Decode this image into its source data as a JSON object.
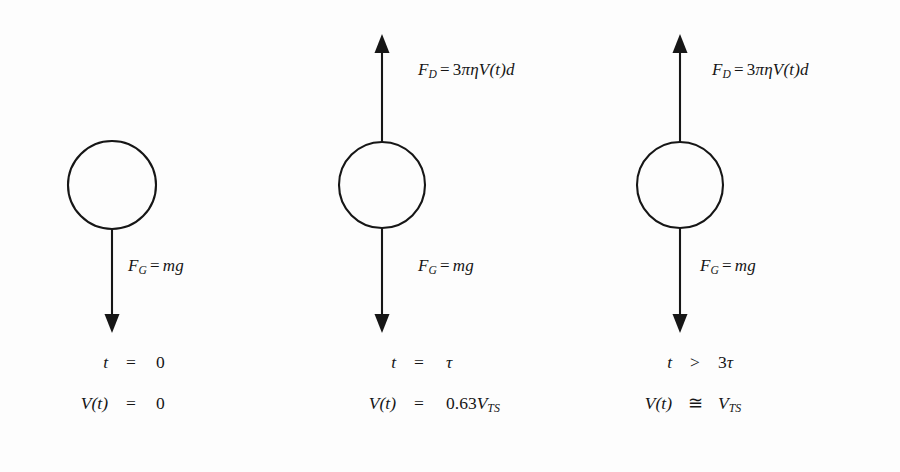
{
  "figure": {
    "background_color": "#fdfdfd",
    "stroke_color": "#161616"
  },
  "panels": [
    {
      "id": "panel-0",
      "sphere_name": "sphere",
      "drag_arrow": {
        "present": false,
        "direction": "up",
        "name": "drag-force-arrow"
      },
      "gravity_arrow": {
        "present": true,
        "direction": "down",
        "name": "gravity-force-arrow"
      },
      "drag_label": {
        "lhs": "F",
        "lhs_sub": "D",
        "op": "=",
        "coefficient": "3",
        "greek": "πη",
        "velocity": "V(t)",
        "diameter": "d",
        "full": "F_D = 3πηV(t)d"
      },
      "gravity_label": {
        "lhs": "F",
        "lhs_sub": "G",
        "op": "=",
        "rhs": "mg",
        "full": "F_G = mg"
      },
      "state": [
        {
          "symbol": "t",
          "relation": "=",
          "value_num": "0",
          "value_sym": "",
          "value_sub": ""
        },
        {
          "symbol": "V(t)",
          "relation": "=",
          "value_num": "0",
          "value_sym": "",
          "value_sub": ""
        }
      ]
    },
    {
      "id": "panel-1",
      "sphere_name": "sphere",
      "drag_arrow": {
        "present": true,
        "direction": "up",
        "name": "drag-force-arrow"
      },
      "gravity_arrow": {
        "present": true,
        "direction": "down",
        "name": "gravity-force-arrow"
      },
      "drag_label": {
        "lhs": "F",
        "lhs_sub": "D",
        "op": "=",
        "coefficient": "3",
        "greek": "πη",
        "velocity": "V(t)",
        "diameter": "d",
        "full": "F_D = 3πηV(t)d"
      },
      "gravity_label": {
        "lhs": "F",
        "lhs_sub": "G",
        "op": "=",
        "rhs": "mg",
        "full": "F_G = mg"
      },
      "state": [
        {
          "symbol": "t",
          "relation": "=",
          "value_num": "",
          "value_sym": "τ",
          "value_sub": ""
        },
        {
          "symbol": "V(t)",
          "relation": "=",
          "value_num": "0.63",
          "value_sym": "V",
          "value_sub": "TS"
        }
      ]
    },
    {
      "id": "panel-2",
      "sphere_name": "sphere",
      "drag_arrow": {
        "present": true,
        "direction": "up",
        "name": "drag-force-arrow"
      },
      "gravity_arrow": {
        "present": true,
        "direction": "down",
        "name": "gravity-force-arrow"
      },
      "drag_label": {
        "lhs": "F",
        "lhs_sub": "D",
        "op": "=",
        "coefficient": "3",
        "greek": "πη",
        "velocity": "V(t)",
        "diameter": "d",
        "full": "F_D = 3πηV(t)d"
      },
      "gravity_label": {
        "lhs": "F",
        "lhs_sub": "G",
        "op": "=",
        "rhs": "mg",
        "full": "F_G = mg"
      },
      "state": [
        {
          "symbol": "t",
          "relation": ">",
          "value_num": "3",
          "value_sym": "τ",
          "value_sub": ""
        },
        {
          "symbol": "V(t)",
          "relation": "≅",
          "value_num": "",
          "value_sym": "V",
          "value_sub": "TS"
        }
      ]
    }
  ]
}
